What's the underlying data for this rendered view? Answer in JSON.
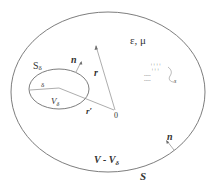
{
  "diagram": {
    "colors": {
      "line": "#6e6e6e",
      "text": "#333333",
      "background": "#ffffff"
    },
    "labels": {
      "medium": "ε, μ",
      "outer_surface": "S",
      "outer_normal": "n",
      "region": "V - V",
      "region_sub": "δ",
      "inner_surface": "S",
      "inner_surface_sub": "δ",
      "inner_normal": "n",
      "inner_volume": "V",
      "inner_volume_sub": "δ",
      "inner_radius": "δ",
      "position_vector": "r",
      "source_vector": "r′",
      "origin": "0",
      "path": "s",
      "positive_charges_row1": "++++",
      "positive_charges_row2": "+++",
      "negative_charges_row1": "----",
      "negative_charges_row2": "----"
    }
  }
}
